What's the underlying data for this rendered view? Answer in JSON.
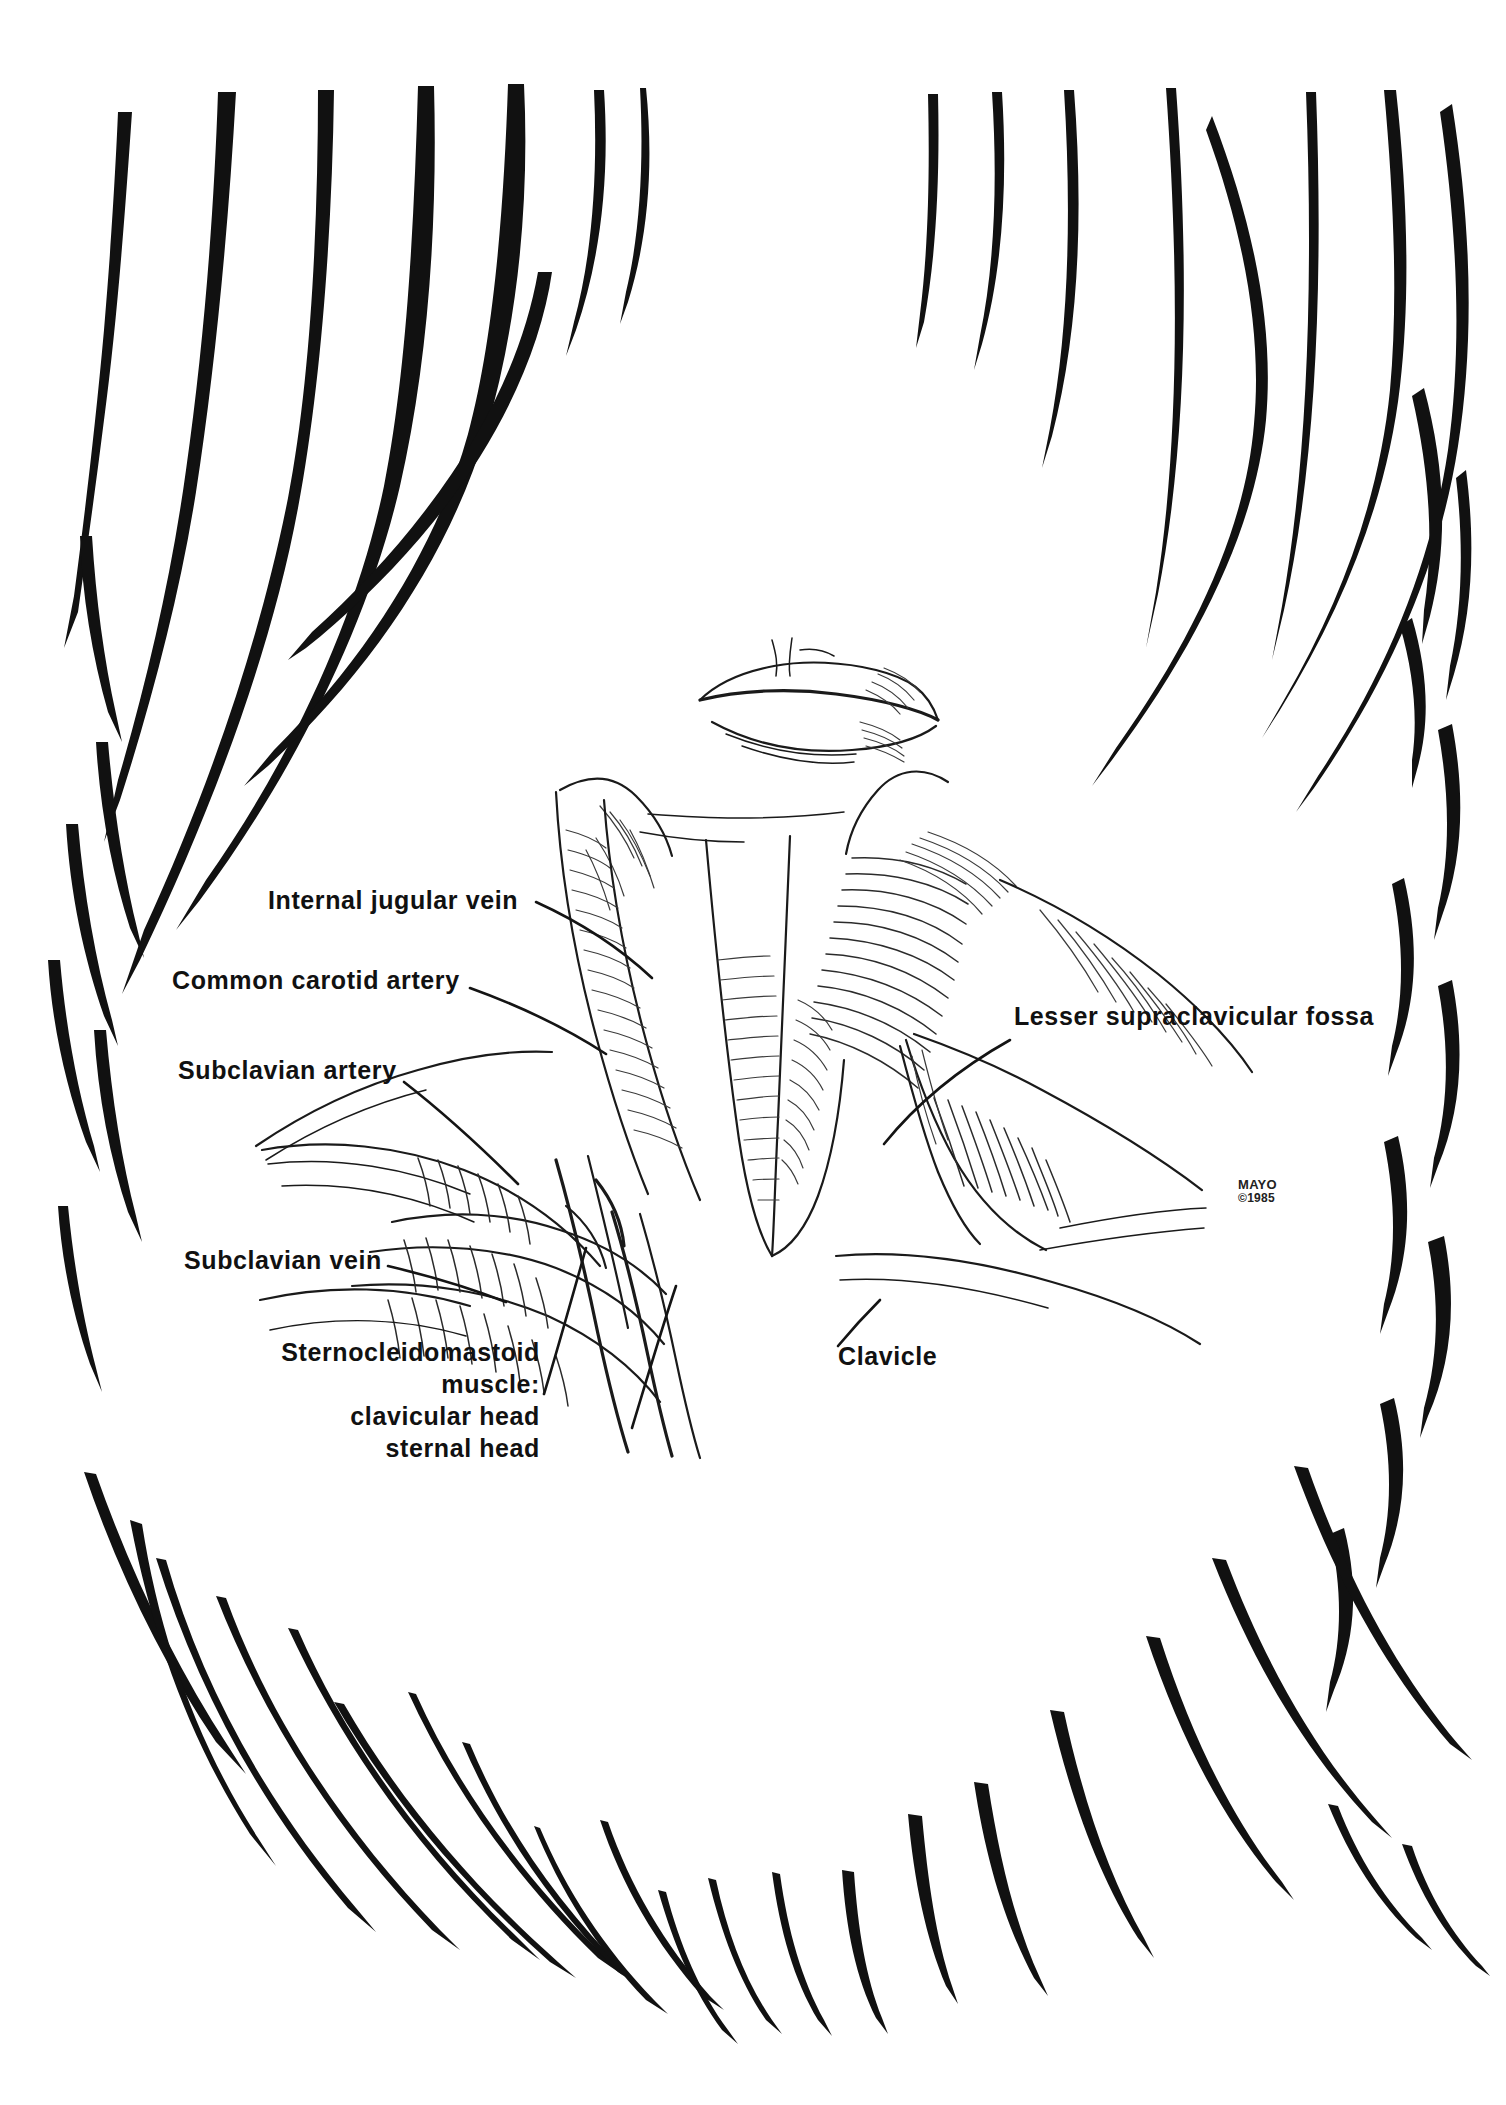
{
  "plate": {
    "kind": "anatomical-illustration",
    "subject": "Anterior neck and root-of-neck surface anatomy, head extended",
    "background_color": "#ffffff",
    "ink_color": "#111111",
    "border_style": "bold tapered brushstroke frame radiating inward from all four edges"
  },
  "labels": [
    {
      "id": "internal-jugular-vein",
      "text": "Internal jugular vein"
    },
    {
      "id": "common-carotid-artery",
      "text": "Common carotid artery"
    },
    {
      "id": "subclavian-artery",
      "text": "Subclavian artery"
    },
    {
      "id": "subclavian-vein",
      "text": "Subclavian vein"
    },
    {
      "id": "lesser-supraclavicular-fossa",
      "text": "Lesser supraclavicular fossa"
    },
    {
      "id": "clavicle",
      "text": "Clavicle"
    }
  ],
  "muscle_label": {
    "line1": "Sternocleidomastoid",
    "line2": "muscle:",
    "line3": "clavicular head",
    "line4": "sternal head"
  },
  "credit": {
    "institution": "MAYO",
    "copyright": "©1985"
  }
}
